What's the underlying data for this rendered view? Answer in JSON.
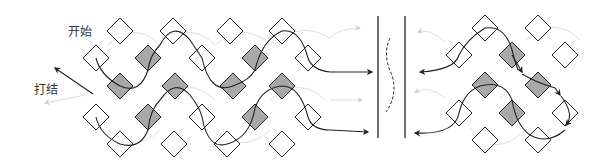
{
  "labels": {
    "start": "开始",
    "tie_knot": "打结"
  },
  "colors": {
    "background": "#ffffff",
    "diamond_fill_gray": "#a8a8a8",
    "diamond_fill_white": "#ffffff",
    "stroke": "#222222",
    "faint_stroke": "#cfcfcf"
  },
  "panels": {
    "left": {
      "diamonds": [
        {
          "x": 120,
          "y": 31,
          "fill": "white"
        },
        {
          "x": 173,
          "y": 31,
          "fill": "white"
        },
        {
          "x": 230,
          "y": 31,
          "fill": "white"
        },
        {
          "x": 282,
          "y": 31,
          "fill": "white"
        },
        {
          "x": 96,
          "y": 58,
          "fill": "white"
        },
        {
          "x": 148,
          "y": 58,
          "fill": "gray"
        },
        {
          "x": 202,
          "y": 58,
          "fill": "white"
        },
        {
          "x": 255,
          "y": 58,
          "fill": "gray"
        },
        {
          "x": 308,
          "y": 58,
          "fill": "white"
        },
        {
          "x": 120,
          "y": 86,
          "fill": "gray"
        },
        {
          "x": 175,
          "y": 86,
          "fill": "gray"
        },
        {
          "x": 233,
          "y": 86,
          "fill": "gray"
        },
        {
          "x": 282,
          "y": 86,
          "fill": "gray"
        },
        {
          "x": 96,
          "y": 117,
          "fill": "white"
        },
        {
          "x": 148,
          "y": 117,
          "fill": "gray"
        },
        {
          "x": 202,
          "y": 117,
          "fill": "white"
        },
        {
          "x": 255,
          "y": 117,
          "fill": "gray"
        },
        {
          "x": 308,
          "y": 117,
          "fill": "white"
        },
        {
          "x": 120,
          "y": 144,
          "fill": "white"
        },
        {
          "x": 174,
          "y": 144,
          "fill": "white"
        },
        {
          "x": 227,
          "y": 144,
          "fill": "white"
        },
        {
          "x": 282,
          "y": 144,
          "fill": "white"
        }
      ]
    },
    "right": {
      "diamonds": [
        {
          "x": 485,
          "y": 28,
          "fill": "white"
        },
        {
          "x": 538,
          "y": 28,
          "fill": "white"
        },
        {
          "x": 459,
          "y": 55,
          "fill": "white"
        },
        {
          "x": 512,
          "y": 55,
          "fill": "gray"
        },
        {
          "x": 565,
          "y": 55,
          "fill": "white"
        },
        {
          "x": 485,
          "y": 85,
          "fill": "gray"
        },
        {
          "x": 538,
          "y": 85,
          "fill": "gray"
        },
        {
          "x": 459,
          "y": 113,
          "fill": "white"
        },
        {
          "x": 512,
          "y": 113,
          "fill": "gray"
        },
        {
          "x": 565,
          "y": 113,
          "fill": "white"
        },
        {
          "x": 485,
          "y": 140,
          "fill": "white"
        },
        {
          "x": 538,
          "y": 140,
          "fill": "white"
        }
      ]
    }
  },
  "divider": {
    "lines_x": [
      378,
      405
    ],
    "top": 16,
    "bottom": 138
  }
}
